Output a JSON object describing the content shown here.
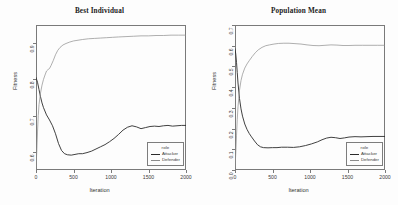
{
  "figure": {
    "background": "#fdfdfd",
    "axis_color": "#7a7a7a",
    "attacker_color": "#2b2b2b",
    "defender_color": "#8c8c8c"
  },
  "panels": [
    {
      "key": "best_individual",
      "title": "Best Individual",
      "xlabel": "Iteration",
      "ylabel": "Fitness",
      "xticks": [
        "0",
        "500",
        "1000",
        "1500",
        "2000"
      ],
      "yticks": [
        "0.6",
        "0.7",
        "0.8",
        "0.9"
      ],
      "legend": {
        "title": "role",
        "entries": [
          {
            "label": "Attacker",
            "color": "#2b2b2b"
          },
          {
            "label": "Defender",
            "color": "#8c8c8c"
          }
        ]
      }
    },
    {
      "key": "population_mean",
      "title": "Population Mean",
      "xlabel": "Iteration",
      "ylabel": "Fitness",
      "xticks": [
        "0",
        "500",
        "1000",
        "1500",
        "2000"
      ],
      "yticks": [
        "0.0",
        "0.1",
        "0.2",
        "0.3",
        "0.4",
        "0.5",
        "0.6",
        "0.7"
      ],
      "legend": {
        "title": "role",
        "entries": [
          {
            "label": "Attacker",
            "color": "#2b2b2b"
          },
          {
            "label": "Defender",
            "color": "#8c8c8c"
          }
        ]
      }
    }
  ],
  "chart_data": [
    {
      "type": "line",
      "panel": "Best Individual",
      "title": "Best Individual",
      "xlabel": "Iteration",
      "ylabel": "Fitness",
      "xlim": [
        0,
        2000
      ],
      "ylim": [
        0.55,
        0.95
      ],
      "xticks": [
        0,
        500,
        1000,
        1500,
        2000
      ],
      "yticks": [
        0.6,
        0.7,
        0.8,
        0.9
      ],
      "grid": false,
      "legend": {
        "title": "role",
        "position": "bottom-right"
      },
      "series": [
        {
          "name": "Attacker",
          "color": "#2b2b2b",
          "x": [
            0,
            20,
            40,
            60,
            80,
            100,
            140,
            180,
            220,
            260,
            300,
            340,
            380,
            420,
            470,
            520,
            570,
            620,
            680,
            740,
            800,
            860,
            920,
            980,
            1040,
            1100,
            1160,
            1220,
            1280,
            1340,
            1400,
            1460,
            1520,
            1580,
            1640,
            1700,
            1760,
            1820,
            1880,
            1940,
            2000
          ],
          "y": [
            0.805,
            0.792,
            0.772,
            0.752,
            0.735,
            0.722,
            0.702,
            0.688,
            0.672,
            0.65,
            0.623,
            0.604,
            0.595,
            0.592,
            0.591,
            0.593,
            0.595,
            0.595,
            0.598,
            0.602,
            0.608,
            0.614,
            0.62,
            0.628,
            0.637,
            0.648,
            0.66,
            0.668,
            0.672,
            0.669,
            0.664,
            0.667,
            0.67,
            0.671,
            0.67,
            0.672,
            0.673,
            0.671,
            0.672,
            0.673,
            0.673
          ]
        },
        {
          "name": "Defender",
          "color": "#8c8c8c",
          "x": [
            0,
            10,
            20,
            30,
            40,
            60,
            80,
            100,
            120,
            140,
            160,
            180,
            200,
            230,
            260,
            290,
            320,
            360,
            400,
            450,
            500,
            560,
            620,
            700,
            780,
            860,
            940,
            1020,
            1100,
            1200,
            1300,
            1400,
            1500,
            1600,
            1700,
            1800,
            1900,
            2000
          ],
          "y": [
            0.555,
            0.6,
            0.655,
            0.7,
            0.73,
            0.762,
            0.784,
            0.8,
            0.812,
            0.823,
            0.827,
            0.83,
            0.838,
            0.852,
            0.868,
            0.88,
            0.888,
            0.895,
            0.899,
            0.903,
            0.906,
            0.908,
            0.91,
            0.912,
            0.913,
            0.914,
            0.915,
            0.916,
            0.917,
            0.918,
            0.919,
            0.92,
            0.92,
            0.921,
            0.921,
            0.922,
            0.922,
            0.922
          ]
        }
      ]
    },
    {
      "type": "line",
      "panel": "Population Mean",
      "title": "Population Mean",
      "xlabel": "Iteration",
      "ylabel": "Fitness",
      "xlim": [
        0,
        2000
      ],
      "ylim": [
        0.0,
        0.7
      ],
      "xticks": [
        0,
        500,
        1000,
        1500,
        2000
      ],
      "yticks": [
        0.0,
        0.1,
        0.2,
        0.3,
        0.4,
        0.5,
        0.6,
        0.7
      ],
      "grid": false,
      "legend": {
        "title": "role",
        "position": "bottom-right"
      },
      "series": [
        {
          "name": "Attacker",
          "color": "#2b2b2b",
          "x": [
            0,
            10,
            20,
            30,
            40,
            60,
            80,
            100,
            130,
            160,
            190,
            220,
            260,
            300,
            340,
            380,
            440,
            500,
            560,
            620,
            700,
            780,
            860,
            940,
            1020,
            1100,
            1160,
            1220,
            1280,
            1340,
            1400,
            1460,
            1520,
            1600,
            1680,
            1760,
            1840,
            1920,
            2000
          ],
          "y": [
            0.585,
            0.56,
            0.52,
            0.47,
            0.42,
            0.345,
            0.295,
            0.26,
            0.222,
            0.196,
            0.176,
            0.16,
            0.14,
            0.122,
            0.112,
            0.108,
            0.107,
            0.108,
            0.108,
            0.11,
            0.11,
            0.109,
            0.112,
            0.118,
            0.126,
            0.136,
            0.146,
            0.154,
            0.158,
            0.156,
            0.152,
            0.155,
            0.159,
            0.161,
            0.16,
            0.161,
            0.162,
            0.162,
            0.162
          ]
        },
        {
          "name": "Defender",
          "color": "#8c8c8c",
          "x": [
            0,
            10,
            20,
            30,
            40,
            60,
            80,
            100,
            130,
            160,
            190,
            230,
            270,
            310,
            360,
            410,
            460,
            520,
            580,
            650,
            720,
            800,
            880,
            960,
            1040,
            1120,
            1200,
            1280,
            1360,
            1440,
            1520,
            1600,
            1700,
            1800,
            1900,
            2000
          ],
          "y": [
            0.01,
            0.08,
            0.165,
            0.245,
            0.305,
            0.385,
            0.432,
            0.462,
            0.492,
            0.512,
            0.528,
            0.548,
            0.566,
            0.58,
            0.592,
            0.6,
            0.604,
            0.608,
            0.611,
            0.612,
            0.612,
            0.61,
            0.608,
            0.604,
            0.601,
            0.6,
            0.602,
            0.604,
            0.603,
            0.601,
            0.601,
            0.602,
            0.602,
            0.602,
            0.602,
            0.602
          ]
        }
      ]
    }
  ]
}
